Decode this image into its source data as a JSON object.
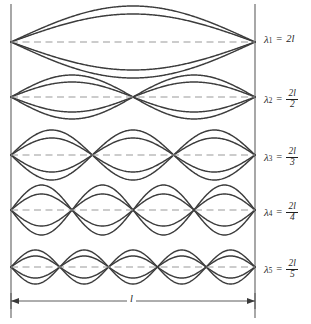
{
  "figure": {
    "string_length_label": "l",
    "wall_color": "#6d6d6d",
    "curve_color": "#3c3c3c",
    "axis_color": "#9a9a9a",
    "background": "#ffffff",
    "left_wall_x": 11,
    "right_wall_x": 255,
    "dimension_line_y": 301
  },
  "harmonics": [
    {
      "index": 1,
      "lambda_symbol": "λ",
      "subscript": "1",
      "equals": "=",
      "value_type": "plain",
      "value": "2l",
      "numerator": "2l",
      "denominator": "1",
      "antinodes": 1,
      "nodes": 2,
      "center_y": 42,
      "amplitude_outer": 36,
      "amplitude_inner": 28,
      "label_x": 264,
      "label_y": 42
    },
    {
      "index": 2,
      "lambda_symbol": "λ",
      "subscript": "2",
      "equals": "=",
      "value_type": "fraction",
      "value": "2l/2",
      "numerator": "2l",
      "denominator": "2",
      "antinodes": 2,
      "nodes": 3,
      "center_y": 97,
      "amplitude_outer": 22,
      "amplitude_inner": 15,
      "label_x": 264,
      "label_y": 97
    },
    {
      "index": 3,
      "lambda_symbol": "λ",
      "subscript": "3",
      "equals": "=",
      "value_type": "fraction",
      "value": "2l/3",
      "numerator": "2l",
      "denominator": "3",
      "antinodes": 3,
      "nodes": 4,
      "center_y": 155,
      "amplitude_outer": 25,
      "amplitude_inner": 17,
      "label_x": 264,
      "label_y": 155
    },
    {
      "index": 4,
      "lambda_symbol": "λ",
      "subscript": "4",
      "equals": "=",
      "value_type": "fraction",
      "value": "2l/4",
      "numerator": "2l",
      "denominator": "4",
      "antinodes": 4,
      "nodes": 5,
      "center_y": 210,
      "amplitude_outer": 25,
      "amplitude_inner": 16,
      "label_x": 264,
      "label_y": 210
    },
    {
      "index": 5,
      "lambda_symbol": "λ",
      "subscript": "5",
      "equals": "=",
      "value_type": "fraction",
      "value": "2l/5",
      "numerator": "2l",
      "denominator": "5",
      "antinodes": 5,
      "nodes": 6,
      "center_y": 267,
      "amplitude_outer": 17,
      "amplitude_inner": 11,
      "label_x": 264,
      "label_y": 267
    }
  ],
  "dimension": {
    "label": "l",
    "label_x": 127,
    "label_y": 301
  }
}
